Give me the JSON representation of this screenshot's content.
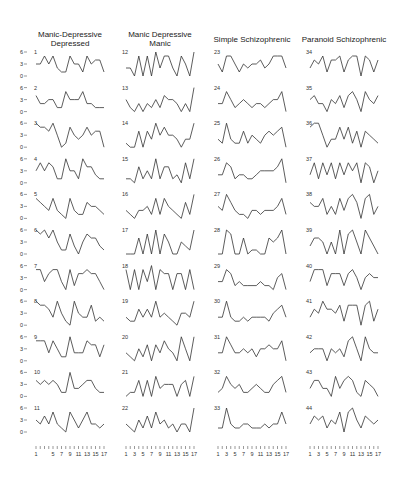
{
  "chart_data": {
    "type": "line",
    "layout": "small-multiples grid, 4 columns x 11 rows",
    "title": "",
    "xlabel": "",
    "ylabel": "",
    "ylim": [
      0,
      6
    ],
    "yticks": [
      0,
      3,
      6
    ],
    "x": [
      1,
      2,
      3,
      4,
      5,
      6,
      7,
      8,
      9,
      10,
      11,
      12,
      13,
      14,
      15,
      16,
      17
    ],
    "xtick_labels": [
      "1",
      "3",
      "5",
      "7",
      "9",
      "11",
      "13",
      "15",
      "17"
    ],
    "grid": false,
    "groups": [
      {
        "name": "Manic-Depressive Depressed",
        "title_lines": [
          "Manic-Depressive",
          "Depressed"
        ],
        "series": [
          {
            "name": "1",
            "values": [
              3,
              3,
              5,
              3,
              5,
              2,
              1,
              1,
              5,
              3,
              3,
              1,
              5,
              3,
              4,
              4,
              1
            ]
          },
          {
            "name": "2",
            "values": [
              4,
              2,
              2,
              3,
              3,
              1,
              1,
              5,
              3,
              3,
              3,
              5,
              2,
              2,
              1,
              1,
              1
            ]
          },
          {
            "name": "3",
            "values": [
              6,
              5,
              5,
              4,
              6,
              3,
              0,
              1,
              5,
              3,
              2,
              3,
              5,
              3,
              4,
              4,
              0
            ]
          },
          {
            "name": "4",
            "values": [
              3,
              5,
              3,
              5,
              4,
              1,
              1,
              6,
              3,
              3,
              1,
              6,
              4,
              4,
              2,
              1,
              1
            ]
          },
          {
            "name": "5",
            "values": [
              5,
              4,
              3,
              2,
              5,
              2,
              1,
              0,
              5,
              2,
              1,
              1,
              4,
              3,
              3,
              2,
              1
            ]
          },
          {
            "name": "6",
            "values": [
              6,
              5,
              6,
              4,
              6,
              3,
              1,
              1,
              5,
              2,
              0,
              3,
              5,
              4,
              4,
              2,
              1
            ]
          },
          {
            "name": "7",
            "values": [
              5,
              5,
              2,
              4,
              5,
              5,
              2,
              0,
              5,
              1,
              4,
              4,
              5,
              4,
              4,
              2,
              0
            ]
          },
          {
            "name": "8",
            "values": [
              6,
              5,
              5,
              4,
              2,
              6,
              3,
              1,
              0,
              6,
              3,
              2,
              2,
              5,
              1,
              2,
              1
            ]
          },
          {
            "name": "9",
            "values": [
              5,
              5,
              5,
              2,
              5,
              3,
              1,
              1,
              6,
              2,
              2,
              2,
              5,
              4,
              4,
              1,
              4
            ]
          },
          {
            "name": "10",
            "values": [
              4,
              3,
              4,
              3,
              4,
              3,
              1,
              1,
              6,
              2,
              2,
              3,
              4,
              4,
              2,
              1,
              1
            ]
          },
          {
            "name": "11",
            "values": [
              3,
              2,
              4,
              2,
              5,
              2,
              1,
              0,
              5,
              3,
              1,
              3,
              5,
              2,
              2,
              1,
              2
            ]
          }
        ]
      },
      {
        "name": "Manic Depressive Manic",
        "title_lines": [
          "Manic Depressive",
          "Manic"
        ],
        "series": [
          {
            "name": "12",
            "values": [
              2,
              2,
              0,
              5,
              0,
              5,
              0,
              6,
              2,
              5,
              5,
              2,
              0,
              5,
              3,
              0,
              6
            ]
          },
          {
            "name": "13",
            "values": [
              3,
              1,
              0,
              2,
              0,
              2,
              1,
              3,
              1,
              4,
              3,
              3,
              2,
              0,
              2,
              0,
              6
            ]
          },
          {
            "name": "14",
            "values": [
              1,
              0,
              0,
              4,
              0,
              4,
              2,
              6,
              3,
              5,
              3,
              3,
              2,
              0,
              2,
              2,
              6
            ]
          },
          {
            "name": "15",
            "values": [
              1,
              1,
              0,
              4,
              1,
              3,
              1,
              6,
              1,
              4,
              4,
              1,
              2,
              0,
              5,
              1,
              6
            ]
          },
          {
            "name": "16",
            "values": [
              2,
              1,
              0,
              2,
              2,
              3,
              1,
              5,
              1,
              5,
              3,
              2,
              1,
              0,
              4,
              1,
              6
            ]
          },
          {
            "name": "17",
            "values": [
              0,
              0,
              0,
              4,
              0,
              5,
              0,
              6,
              0,
              5,
              3,
              0,
              0,
              3,
              2,
              1,
              6
            ]
          },
          {
            "name": "18",
            "values": [
              5,
              0,
              5,
              0,
              5,
              2,
              6,
              0,
              5,
              4,
              4,
              0,
              4,
              4,
              0,
              5,
              0
            ]
          },
          {
            "name": "19",
            "values": [
              2,
              1,
              1,
              4,
              2,
              4,
              2,
              6,
              2,
              3,
              2,
              1,
              0,
              3,
              3,
              2,
              6
            ]
          },
          {
            "name": "20",
            "values": [
              2,
              1,
              0,
              3,
              1,
              4,
              0,
              4,
              2,
              5,
              3,
              2,
              0,
              6,
              3,
              0,
              6
            ]
          },
          {
            "name": "21",
            "values": [
              0,
              1,
              1,
              4,
              0,
              4,
              0,
              5,
              2,
              3,
              3,
              3,
              0,
              3,
              4,
              0,
              5
            ]
          },
          {
            "name": "22",
            "values": [
              2,
              1,
              0,
              3,
              1,
              4,
              1,
              5,
              2,
              3,
              1,
              2,
              0,
              2,
              2,
              0,
              6
            ]
          }
        ]
      },
      {
        "name": "Simple Schizophrenic",
        "title_lines": [
          "Simple Schizophrenic"
        ],
        "series": [
          {
            "name": "23",
            "values": [
              3,
              1,
              5,
              5,
              3,
              1,
              3,
              2,
              3,
              3,
              4,
              2,
              3,
              5,
              5,
              5,
              2
            ]
          },
          {
            "name": "24",
            "values": [
              2,
              2,
              5,
              3,
              1,
              2,
              3,
              2,
              1,
              2,
              2,
              1,
              2,
              3,
              3,
              5,
              0
            ]
          },
          {
            "name": "25",
            "values": [
              2,
              1,
              6,
              2,
              1,
              1,
              4,
              1,
              3,
              2,
              1,
              3,
              4,
              3,
              4,
              5,
              0
            ]
          },
          {
            "name": "26",
            "values": [
              2,
              2,
              5,
              4,
              1,
              2,
              2,
              1,
              1,
              2,
              3,
              3,
              3,
              3,
              4,
              6,
              0
            ]
          },
          {
            "name": "27",
            "values": [
              3,
              2,
              6,
              4,
              2,
              1,
              1,
              0,
              2,
              2,
              1,
              2,
              2,
              2,
              3,
              5,
              1
            ]
          },
          {
            "name": "28",
            "values": [
              0,
              0,
              6,
              5,
              0,
              0,
              4,
              0,
              1,
              1,
              0,
              0,
              4,
              3,
              4,
              6,
              0
            ]
          },
          {
            "name": "29",
            "values": [
              2,
              2,
              5,
              4,
              1,
              2,
              1,
              1,
              1,
              1,
              2,
              1,
              1,
              0,
              3,
              4,
              0
            ]
          },
          {
            "name": "30",
            "values": [
              2,
              2,
              6,
              2,
              1,
              1,
              2,
              1,
              2,
              2,
              2,
              2,
              1,
              3,
              4,
              5,
              2
            ]
          },
          {
            "name": "31",
            "values": [
              2,
              2,
              6,
              4,
              2,
              2,
              3,
              2,
              3,
              1,
              3,
              3,
              4,
              3,
              3,
              5,
              0
            ]
          },
          {
            "name": "32",
            "values": [
              1,
              2,
              5,
              3,
              2,
              3,
              1,
              1,
              2,
              3,
              2,
              1,
              1,
              3,
              4,
              5,
              1
            ]
          },
          {
            "name": "33",
            "values": [
              1,
              1,
              6,
              2,
              1,
              1,
              2,
              2,
              1,
              1,
              1,
              2,
              1,
              2,
              2,
              5,
              2
            ]
          }
        ]
      },
      {
        "name": "Paranoid Schizophrenic",
        "title_lines": [
          "Paranoid Schizophrenic"
        ],
        "series": [
          {
            "name": "34",
            "values": [
              2,
              4,
              3,
              5,
              1,
              4,
              4,
              5,
              1,
              4,
              5,
              5,
              0,
              5,
              4,
              1,
              4
            ]
          },
          {
            "name": "35",
            "values": [
              3,
              4,
              2,
              2,
              0,
              3,
              2,
              4,
              1,
              4,
              5,
              3,
              0,
              5,
              3,
              2,
              4
            ]
          },
          {
            "name": "36",
            "values": [
              5,
              6,
              6,
              3,
              0,
              2,
              2,
              5,
              2,
              5,
              1,
              4,
              0,
              4,
              3,
              2,
              1
            ]
          },
          {
            "name": "37",
            "values": [
              2,
              5,
              1,
              5,
              2,
              5,
              1,
              5,
              2,
              5,
              3,
              5,
              0,
              5,
              4,
              0,
              3
            ]
          },
          {
            "name": "38",
            "values": [
              4,
              3,
              3,
              5,
              1,
              3,
              1,
              5,
              2,
              5,
              6,
              4,
              0,
              5,
              6,
              1,
              3
            ]
          },
          {
            "name": "39",
            "values": [
              2,
              4,
              4,
              3,
              0,
              3,
              0,
              6,
              0,
              5,
              6,
              3,
              0,
              6,
              4,
              2,
              0
            ]
          },
          {
            "name": "40",
            "values": [
              2,
              5,
              5,
              5,
              1,
              4,
              4,
              4,
              1,
              4,
              5,
              3,
              0,
              3,
              4,
              3,
              3
            ]
          },
          {
            "name": "41",
            "values": [
              2,
              4,
              3,
              6,
              4,
              4,
              3,
              5,
              1,
              5,
              5,
              5,
              0,
              5,
              6,
              1,
              4
            ]
          },
          {
            "name": "42",
            "values": [
              2,
              3,
              3,
              3,
              0,
              3,
              2,
              3,
              1,
              5,
              6,
              3,
              0,
              6,
              3,
              2,
              2
            ]
          },
          {
            "name": "43",
            "values": [
              2,
              4,
              4,
              2,
              2,
              0,
              5,
              2,
              4,
              5,
              4,
              1,
              0,
              4,
              3,
              2,
              0
            ]
          },
          {
            "name": "44",
            "values": [
              2,
              4,
              3,
              4,
              1,
              3,
              2,
              5,
              0,
              5,
              6,
              3,
              1,
              4,
              3,
              2,
              3
            ]
          }
        ]
      }
    ]
  }
}
